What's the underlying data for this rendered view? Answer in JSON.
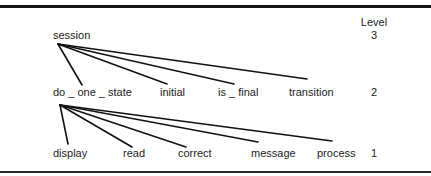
{
  "diagram": {
    "type": "hierarchy-tree",
    "level_header": "Level",
    "levels": [
      {
        "level": "3",
        "nodes": [
          {
            "id": "session",
            "label": "session"
          }
        ]
      },
      {
        "level": "2",
        "nodes": [
          {
            "id": "do_one_state",
            "label": "do _ one _ state"
          },
          {
            "id": "initial",
            "label": "initial"
          },
          {
            "id": "is_final",
            "label": "is _ final"
          },
          {
            "id": "transition",
            "label": "transition"
          }
        ]
      },
      {
        "level": "1",
        "nodes": [
          {
            "id": "display",
            "label": "display"
          },
          {
            "id": "read",
            "label": "read"
          },
          {
            "id": "correct",
            "label": "correct"
          },
          {
            "id": "message",
            "label": "message"
          },
          {
            "id": "process",
            "label": "process"
          }
        ]
      }
    ],
    "edges": [
      {
        "from": "session",
        "to": "do_one_state"
      },
      {
        "from": "session",
        "to": "initial"
      },
      {
        "from": "session",
        "to": "is_final"
      },
      {
        "from": "session",
        "to": "transition"
      },
      {
        "from": "do_one_state",
        "to": "display"
      },
      {
        "from": "do_one_state",
        "to": "read"
      },
      {
        "from": "do_one_state",
        "to": "correct"
      },
      {
        "from": "do_one_state",
        "to": "message"
      },
      {
        "from": "do_one_state",
        "to": "process"
      }
    ],
    "colors": {
      "line": "#111111",
      "text": "#1c1c1c",
      "background": "#ffffff"
    }
  }
}
